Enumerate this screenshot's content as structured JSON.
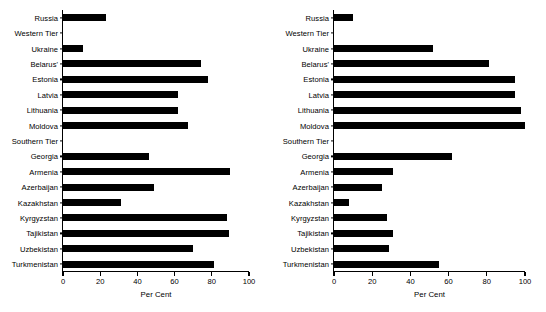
{
  "figure": {
    "panel_count": 2,
    "bar_color": "#000000",
    "axis_color": "#000000",
    "background": "#ffffff"
  },
  "chart_data": [
    {
      "type": "bar",
      "orientation": "horizontal",
      "title": "",
      "xlabel": "Per Cent",
      "ylabel": "",
      "xlim": [
        0,
        100
      ],
      "xticks": [
        0,
        20,
        40,
        60,
        80,
        100
      ],
      "xticklabels": [
        "0",
        "20",
        "40",
        "60",
        "80",
        "100"
      ],
      "grid": false,
      "legend": false,
      "categories": [
        "Russia",
        "Western Tier",
        "Ukraine",
        "Belarus'",
        "Estonia",
        "Latvia",
        "Lithuania",
        "Moldova",
        "Southern Tier",
        "Georgia",
        "Armenia",
        "Azerbaijan",
        "Kazakhstan",
        "Kyrgyzstan",
        "Tajikistan",
        "Uzbekistan",
        "Turkmenistan"
      ],
      "values": [
        23,
        null,
        11,
        74,
        78,
        62,
        62,
        67,
        null,
        46,
        90,
        49,
        31,
        88,
        89,
        70,
        81
      ]
    },
    {
      "type": "bar",
      "orientation": "horizontal",
      "title": "",
      "xlabel": "Per Cent",
      "ylabel": "",
      "xlim": [
        0,
        100
      ],
      "xticks": [
        0,
        20,
        40,
        60,
        80,
        100
      ],
      "xticklabels": [
        "0",
        "20",
        "40",
        "60",
        "80",
        "100"
      ],
      "grid": false,
      "legend": false,
      "categories": [
        "Russia",
        "Western Tier",
        "Ukraine",
        "Belarus'",
        "Estonia",
        "Latvia",
        "Lithuania",
        "Moldova",
        "Southern Tier",
        "Georgia",
        "Armenia",
        "Azerbaijan",
        "Kazakhstan",
        "Kyrgyzstan",
        "Tajikistan",
        "Uzbekistan",
        "Turkmenistan"
      ],
      "values": [
        10,
        null,
        52,
        81,
        95,
        95,
        98,
        100,
        null,
        62,
        31,
        25,
        8,
        28,
        31,
        29,
        55
      ]
    }
  ]
}
